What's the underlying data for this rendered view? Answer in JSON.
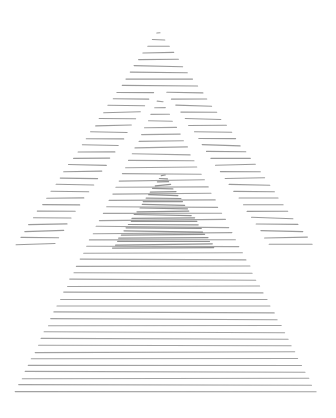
{
  "artwork": {
    "description": "Hand-drawn hatched line art of overlapping triangles",
    "background": "#ffffff",
    "line_color": "#8a8a8a",
    "dense_line_color": "#6e6e6e",
    "line_spacing": 6.6,
    "shapes": {
      "upper_triangle": {
        "apex": [
          158,
          30
        ],
        "base_y": 246,
        "base_left": 14,
        "base_right": 314
      },
      "gap_wedge": {
        "apex": [
          160,
          86
        ],
        "base_y": 246,
        "left_edge_start": 56,
        "left_edge_end": 70,
        "right_edge_start": 254,
        "right_edge_end": 268
      },
      "lower_triangle": {
        "apex": [
          160,
          92
        ],
        "base_y": 392,
        "base_left": 13,
        "base_right": 318
      },
      "core_triangle": {
        "apex": [
          163,
          172
        ],
        "base_y": 248,
        "base_left": 112,
        "base_right": 215
      }
    }
  }
}
